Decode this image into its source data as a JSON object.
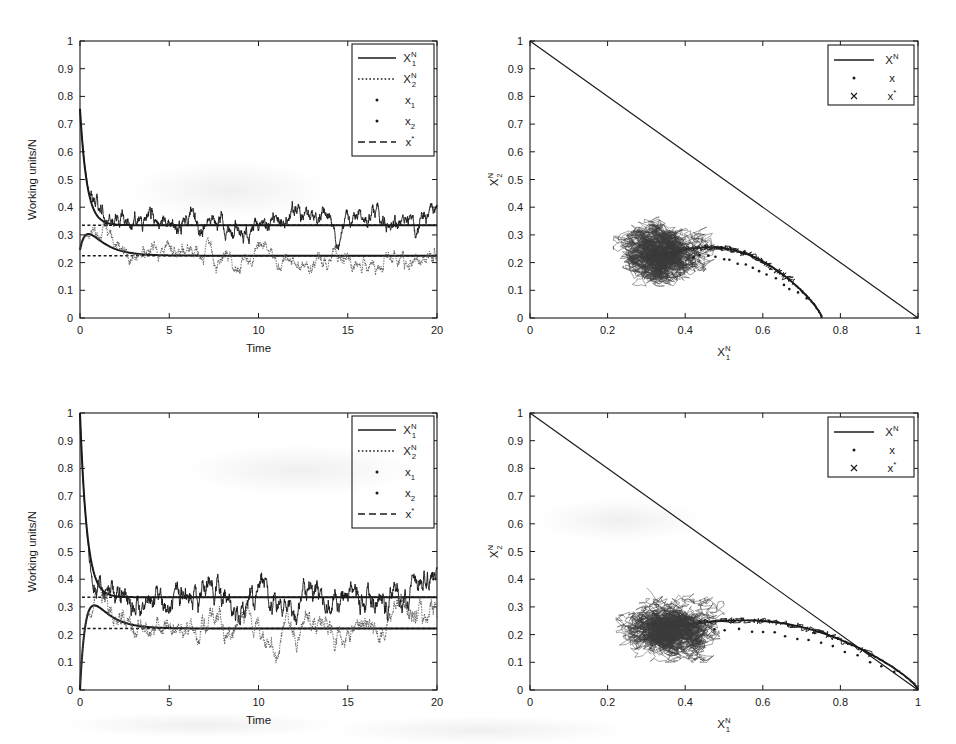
{
  "figure": {
    "background_color": "#ffffff",
    "line_color": "#1a1a1a",
    "width": 956,
    "height": 744
  },
  "panels": [
    {
      "id": "top-left",
      "type": "timeseries",
      "xlabel": "Time",
      "ylabel": "Working units/N",
      "xlim": [
        0,
        20
      ],
      "ylim": [
        0,
        1
      ],
      "xticks": [
        "0",
        "5",
        "10",
        "15",
        "20"
      ],
      "xtick_values": [
        0,
        5,
        10,
        15,
        20
      ],
      "yticks": [
        "0",
        "0.1",
        "0.2",
        "0.3",
        "0.4",
        "0.5",
        "0.6",
        "0.7",
        "0.8",
        "0.9",
        "1"
      ],
      "ytick_values": [
        0,
        0.1,
        0.2,
        0.3,
        0.4,
        0.5,
        0.6,
        0.7,
        0.8,
        0.9,
        1
      ],
      "legend": [
        {
          "label": "X",
          "sup": "N",
          "sub": "1",
          "style": "solid-line",
          "name": "legend-item-x1n"
        },
        {
          "label": "X",
          "sup": "N",
          "sub": "2",
          "style": "dotted-line",
          "name": "legend-item-x2n"
        },
        {
          "label": "x",
          "sup": "",
          "sub": "1",
          "style": "dot-marker",
          "name": "legend-item-x1"
        },
        {
          "label": "x",
          "sup": "",
          "sub": "2",
          "style": "dot-marker",
          "name": "legend-item-x2"
        },
        {
          "label": "x",
          "sup": "*",
          "sub": "",
          "style": "dashed-line",
          "name": "legend-item-xstar"
        }
      ],
      "equilibrium_levels": [
        0.335,
        0.225
      ],
      "deterministic_x1": {
        "start": 0.755,
        "settle": 0.335
      },
      "deterministic_x2": {
        "start": 0.245,
        "peak": 0.3,
        "settle": 0.225
      },
      "noise_amplitude_x1": 0.045,
      "noise_amplitude_x2": 0.038
    },
    {
      "id": "top-right",
      "type": "phase",
      "xlabel": "X",
      "xlabel_sup": "N",
      "xlabel_sub": "1",
      "ylabel": "X",
      "ylabel_sup": "N",
      "ylabel_sub": "2",
      "xlim": [
        0,
        1
      ],
      "ylim": [
        0,
        1
      ],
      "xticks": [
        "0",
        "0.2",
        "0.4",
        "0.6",
        "0.8",
        "1"
      ],
      "xtick_values": [
        0,
        0.2,
        0.4,
        0.6,
        0.8,
        1
      ],
      "yticks": [
        "0",
        "0.1",
        "0.2",
        "0.3",
        "0.4",
        "0.5",
        "0.6",
        "0.7",
        "0.8",
        "0.9",
        "1"
      ],
      "ytick_values": [
        0,
        0.1,
        0.2,
        0.3,
        0.4,
        0.5,
        0.6,
        0.7,
        0.8,
        0.9,
        1
      ],
      "legend": [
        {
          "label": "X",
          "sup": "N",
          "sub": "",
          "style": "solid-line",
          "name": "legend-item-xn"
        },
        {
          "label": "x",
          "sup": "",
          "sub": "",
          "style": "dot-marker",
          "name": "legend-item-x"
        },
        {
          "label": "x",
          "sup": "*",
          "sub": "",
          "style": "cross-marker",
          "name": "legend-item-xstar"
        }
      ],
      "diagonal": {
        "from": [
          0,
          1
        ],
        "to": [
          1,
          0
        ]
      },
      "trajectory_start": [
        0.752,
        0.0
      ],
      "cloud_center": [
        0.345,
        0.232
      ],
      "cloud_extent_x": [
        0.215,
        0.475
      ],
      "cloud_extent_y": [
        0.115,
        0.365
      ]
    },
    {
      "id": "bottom-left",
      "type": "timeseries",
      "xlabel": "Time",
      "ylabel": "Working units/N",
      "xlim": [
        0,
        20
      ],
      "ylim": [
        0,
        1
      ],
      "xticks": [
        "0",
        "5",
        "10",
        "15",
        "20"
      ],
      "xtick_values": [
        0,
        5,
        10,
        15,
        20
      ],
      "yticks": [
        "0",
        "0.1",
        "0.2",
        "0.3",
        "0.4",
        "0.5",
        "0.6",
        "0.7",
        "0.8",
        "0.9",
        "1"
      ],
      "ytick_values": [
        0,
        0.1,
        0.2,
        0.3,
        0.4,
        0.5,
        0.6,
        0.7,
        0.8,
        0.9,
        1
      ],
      "legend": [
        {
          "label": "X",
          "sup": "N",
          "sub": "1",
          "style": "solid-line",
          "name": "legend-item-x1n"
        },
        {
          "label": "X",
          "sup": "N",
          "sub": "2",
          "style": "dotted-line",
          "name": "legend-item-x2n"
        },
        {
          "label": "x",
          "sup": "",
          "sub": "1",
          "style": "dot-marker",
          "name": "legend-item-x1"
        },
        {
          "label": "x",
          "sup": "",
          "sub": "2",
          "style": "dot-marker",
          "name": "legend-item-x2"
        },
        {
          "label": "x",
          "sup": "*",
          "sub": "",
          "style": "dashed-line",
          "name": "legend-item-xstar"
        }
      ],
      "equilibrium_levels": [
        0.335,
        0.222
      ],
      "deterministic_x1": {
        "start": 1.0,
        "settle": 0.335
      },
      "deterministic_x2": {
        "start": 0.0,
        "peak": 0.335,
        "settle": 0.222
      },
      "noise_amplitude_x1": 0.06,
      "noise_amplitude_x2": 0.05
    },
    {
      "id": "bottom-right",
      "type": "phase",
      "xlabel": "X",
      "xlabel_sup": "N",
      "xlabel_sub": "1",
      "ylabel": "X",
      "ylabel_sup": "N",
      "ylabel_sub": "2",
      "xlim": [
        0,
        1
      ],
      "ylim": [
        0,
        1
      ],
      "xticks": [
        "0",
        "0.2",
        "0.4",
        "0.6",
        "0.8",
        "1"
      ],
      "xtick_values": [
        0,
        0.2,
        0.4,
        0.6,
        0.8,
        1
      ],
      "yticks": [
        "0",
        "0.1",
        "0.2",
        "0.3",
        "0.4",
        "0.5",
        "0.6",
        "0.7",
        "0.8",
        "0.9",
        "1"
      ],
      "ytick_values": [
        0,
        0.1,
        0.2,
        0.3,
        0.4,
        0.5,
        0.6,
        0.7,
        0.8,
        0.9,
        1
      ],
      "legend": [
        {
          "label": "X",
          "sup": "N",
          "sub": "",
          "style": "solid-line",
          "name": "legend-item-xn"
        },
        {
          "label": "x",
          "sup": "",
          "sub": "",
          "style": "dot-marker",
          "name": "legend-item-x"
        },
        {
          "label": "x",
          "sup": "*",
          "sub": "",
          "style": "cross-marker",
          "name": "legend-item-xstar"
        }
      ],
      "diagonal": {
        "from": [
          0,
          1
        ],
        "to": [
          1,
          0
        ]
      },
      "trajectory_start": [
        1.0,
        0.0
      ],
      "cloud_center": [
        0.36,
        0.228
      ],
      "cloud_extent_x": [
        0.222,
        0.5
      ],
      "cloud_extent_y": [
        0.1,
        0.372
      ]
    }
  ],
  "chart_data": [
    {
      "type": "line",
      "id": "top-left",
      "title": "",
      "xlabel": "Time",
      "ylabel": "Working units/N",
      "xlim": [
        0,
        20
      ],
      "ylim": [
        0,
        1
      ],
      "grid": false,
      "legend_position": "top-right",
      "series": [
        {
          "name": "X_1^N",
          "style": "solid",
          "description": "stochastic trajectory starting 0.755 decaying to fluctuate about 0.335",
          "x": [
            0,
            0.5,
            1,
            1.5,
            2,
            2.5,
            3,
            3.5,
            4,
            4.5,
            5,
            5.5,
            6,
            6.5,
            7,
            7.5,
            8,
            8.5,
            9,
            9.5,
            10,
            10.5,
            11,
            11.5,
            12,
            12.5,
            13,
            13.5,
            14,
            14.5,
            15,
            15.5,
            16,
            16.5,
            17,
            17.5,
            18,
            18.5,
            19,
            19.5,
            20
          ],
          "values": [
            0.755,
            0.5,
            0.355,
            0.33,
            0.4,
            0.42,
            0.41,
            0.365,
            0.35,
            0.36,
            0.39,
            0.345,
            0.36,
            0.4,
            0.44,
            0.4,
            0.355,
            0.33,
            0.44,
            0.4,
            0.38,
            0.41,
            0.39,
            0.345,
            0.37,
            0.41,
            0.43,
            0.4,
            0.355,
            0.42,
            0.35,
            0.31,
            0.3,
            0.335,
            0.355,
            0.38,
            0.41,
            0.33,
            0.305,
            0.35,
            0.38
          ]
        },
        {
          "name": "X_2^N",
          "style": "dotted",
          "description": "stochastic trajectory rising to 0.30 then fluctuating about 0.225",
          "x": [
            0,
            0.5,
            1,
            1.5,
            2,
            2.5,
            3,
            3.5,
            4,
            4.5,
            5,
            5.5,
            6,
            6.5,
            7,
            7.5,
            8,
            8.5,
            9,
            9.5,
            10,
            10.5,
            11,
            11.5,
            12,
            12.5,
            13,
            13.5,
            14,
            14.5,
            15,
            15.5,
            16,
            16.5,
            17,
            17.5,
            18,
            18.5,
            19,
            19.5,
            20
          ],
          "values": [
            0.245,
            0.295,
            0.255,
            0.23,
            0.24,
            0.265,
            0.225,
            0.175,
            0.185,
            0.21,
            0.23,
            0.2,
            0.195,
            0.21,
            0.225,
            0.195,
            0.175,
            0.2,
            0.23,
            0.25,
            0.27,
            0.24,
            0.21,
            0.23,
            0.275,
            0.245,
            0.215,
            0.235,
            0.27,
            0.245,
            0.21,
            0.17,
            0.145,
            0.19,
            0.225,
            0.235,
            0.3,
            0.22,
            0.165,
            0.2,
            0.235
          ]
        },
        {
          "name": "x_1",
          "style": "dot-marker",
          "description": "deterministic ODE solution for x1, decays 0.755 to 0.335"
        },
        {
          "name": "x_2",
          "style": "dot-marker",
          "description": "deterministic ODE solution for x2, peaks 0.30 then to 0.225"
        },
        {
          "name": "x*",
          "style": "dashed",
          "description": "equilibrium levels",
          "values": [
            0.335,
            0.225
          ]
        }
      ]
    },
    {
      "type": "scatter",
      "id": "top-right",
      "title": "",
      "xlabel": "X_1^N",
      "ylabel": "X_2^N",
      "xlim": [
        0,
        1
      ],
      "ylim": [
        0,
        1
      ],
      "grid": false,
      "legend_position": "top-right",
      "series": [
        {
          "name": "X^N",
          "style": "solid",
          "description": "diagonal constraint line from (0,1) to (1,0)"
        },
        {
          "name": "x",
          "style": "dot-marker",
          "description": "phase trajectory from (0.752,0) rising to cloud centered (0.345,0.232)"
        },
        {
          "name": "x*",
          "style": "cross-marker",
          "description": "equilibrium point",
          "point": [
            0.335,
            0.225
          ]
        }
      ]
    },
    {
      "type": "line",
      "id": "bottom-left",
      "title": "",
      "xlabel": "Time",
      "ylabel": "Working units/N",
      "xlim": [
        0,
        20
      ],
      "ylim": [
        0,
        1
      ],
      "grid": false,
      "legend_position": "top-right",
      "series": [
        {
          "name": "X_1^N",
          "style": "solid",
          "description": "stochastic trajectory starting 1.0 decaying to fluctuate about 0.335",
          "x": [
            0,
            0.5,
            1,
            1.5,
            2,
            2.5,
            3,
            3.5,
            4,
            4.5,
            5,
            5.5,
            6,
            6.5,
            7,
            7.5,
            8,
            8.5,
            9,
            9.5,
            10,
            10.5,
            11,
            11.5,
            12,
            12.5,
            13,
            13.5,
            14,
            14.5,
            15,
            15.5,
            16,
            16.5,
            17,
            17.5,
            18,
            18.5,
            19,
            19.5,
            20
          ],
          "values": [
            1.0,
            0.62,
            0.4,
            0.33,
            0.315,
            0.3,
            0.325,
            0.295,
            0.34,
            0.4,
            0.45,
            0.36,
            0.34,
            0.375,
            0.41,
            0.46,
            0.485,
            0.44,
            0.42,
            0.395,
            0.37,
            0.4,
            0.445,
            0.4,
            0.325,
            0.3,
            0.355,
            0.39,
            0.48,
            0.42,
            0.36,
            0.4,
            0.445,
            0.41,
            0.48,
            0.42,
            0.39,
            0.31,
            0.28,
            0.32,
            0.37
          ]
        },
        {
          "name": "X_2^N",
          "style": "dotted",
          "description": "stochastic trajectory peaking 0.335 then fluctuating about 0.222",
          "x": [
            0,
            0.5,
            1,
            1.5,
            2,
            2.5,
            3,
            3.5,
            4,
            4.5,
            5,
            5.5,
            6,
            6.5,
            7,
            7.5,
            8,
            8.5,
            9,
            9.5,
            10,
            10.5,
            11,
            11.5,
            12,
            12.5,
            13,
            13.5,
            14,
            14.5,
            15,
            15.5,
            16,
            16.5,
            17,
            17.5,
            18,
            18.5,
            19,
            19.5,
            20
          ],
          "values": [
            0.0,
            0.335,
            0.29,
            0.235,
            0.2,
            0.175,
            0.21,
            0.19,
            0.165,
            0.2,
            0.225,
            0.2,
            0.175,
            0.21,
            0.235,
            0.265,
            0.285,
            0.245,
            0.215,
            0.33,
            0.25,
            0.225,
            0.275,
            0.235,
            0.205,
            0.19,
            0.225,
            0.21,
            0.175,
            0.15,
            0.215,
            0.26,
            0.235,
            0.21,
            0.24,
            0.265,
            0.305,
            0.235,
            0.195,
            0.215,
            0.24
          ]
        },
        {
          "name": "x_1",
          "style": "dot-marker",
          "description": "deterministic ODE solution for x1, decays 1.0 to 0.335"
        },
        {
          "name": "x_2",
          "style": "dot-marker",
          "description": "deterministic ODE solution for x2, peaks 0.335 then to 0.222"
        },
        {
          "name": "x*",
          "style": "dashed",
          "description": "equilibrium levels",
          "values": [
            0.335,
            0.222
          ]
        }
      ]
    },
    {
      "type": "scatter",
      "id": "bottom-right",
      "title": "",
      "xlabel": "X_1^N",
      "ylabel": "X_2^N",
      "xlim": [
        0,
        1
      ],
      "ylim": [
        0,
        1
      ],
      "grid": false,
      "legend_position": "top-right",
      "series": [
        {
          "name": "X^N",
          "style": "solid",
          "description": "diagonal constraint line from (0,1) to (1,0)"
        },
        {
          "name": "x",
          "style": "dot-marker",
          "description": "phase trajectory from (1.0,0) along diagonal into cloud centered (0.360,0.228)"
        },
        {
          "name": "x*",
          "style": "cross-marker",
          "description": "equilibrium point",
          "point": [
            0.335,
            0.222
          ]
        }
      ]
    }
  ]
}
